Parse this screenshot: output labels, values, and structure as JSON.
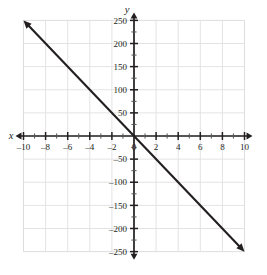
{
  "chart_data": {
    "type": "line",
    "title": "",
    "xlabel": "x",
    "ylabel": "y",
    "xlim": [
      -10,
      10
    ],
    "ylim": [
      -250,
      250
    ],
    "grid": true,
    "legend": "none",
    "x_ticks": [
      -10,
      -8,
      -6,
      -4,
      -2,
      0,
      2,
      4,
      6,
      8,
      10
    ],
    "x_tick_labels": [
      "–10",
      "–8",
      "–6",
      "–4",
      "–2",
      "0",
      "2",
      "4",
      "6",
      "8",
      "10"
    ],
    "y_ticks": [
      250,
      200,
      150,
      100,
      50,
      -50,
      -100,
      -150,
      -200,
      -250
    ],
    "y_tick_labels": [
      "250",
      "200",
      "150",
      "100",
      "50",
      "–50",
      "–100",
      "–150",
      "–200",
      "–250"
    ],
    "x_gridlines": [
      -10,
      -8,
      -6,
      -4,
      -2,
      0,
      2,
      4,
      6,
      8,
      10
    ],
    "y_gridlines": [
      250,
      200,
      150,
      100,
      50,
      0,
      -50,
      -100,
      -150,
      -200,
      -250
    ],
    "x_minor_tick_step": 1,
    "y_minor_tick_step": 25,
    "series": [
      {
        "name": "line",
        "slope": -25,
        "intercept": 0,
        "x": [
          -10,
          10
        ],
        "values": [
          250,
          -250
        ],
        "arrow_start": true,
        "arrow_end": true,
        "color": "#231f20"
      }
    ],
    "axis_arrows": {
      "x_left": true,
      "x_right": true,
      "y_up": true,
      "y_down": true
    },
    "colors": {
      "grid": "#e3e3e6",
      "axis": "#231f20",
      "line": "#231f20",
      "background": "#ffffff"
    }
  }
}
